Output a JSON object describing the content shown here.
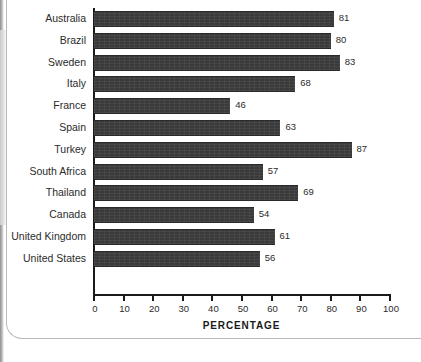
{
  "chart_data": {
    "type": "bar",
    "orientation": "horizontal",
    "title": "",
    "xlabel": "PERCENTAGE",
    "ylabel": "",
    "xlim": [
      0,
      100
    ],
    "xticks": [
      0,
      10,
      20,
      30,
      40,
      50,
      60,
      70,
      80,
      90,
      100
    ],
    "grid": false,
    "legend": null,
    "bar_color": "#3a3a3a",
    "categories": [
      "Australia",
      "Brazil",
      "Sweden",
      "Italy",
      "France",
      "Spain",
      "Turkey",
      "South Africa",
      "Thailand",
      "Canada",
      "United Kingdom",
      "United States"
    ],
    "values": [
      81,
      80,
      83,
      68,
      46,
      63,
      87,
      57,
      69,
      54,
      61,
      56
    ],
    "data_labels": [
      "81",
      "80",
      "83",
      "68",
      "46",
      "63",
      "87",
      "57",
      "69",
      "54",
      "61",
      "56"
    ]
  },
  "axis": {
    "x_title": "PERCENTAGE",
    "tick_labels": [
      "0",
      "10",
      "20",
      "30",
      "40",
      "50",
      "60",
      "70",
      "80",
      "90",
      "100"
    ]
  }
}
